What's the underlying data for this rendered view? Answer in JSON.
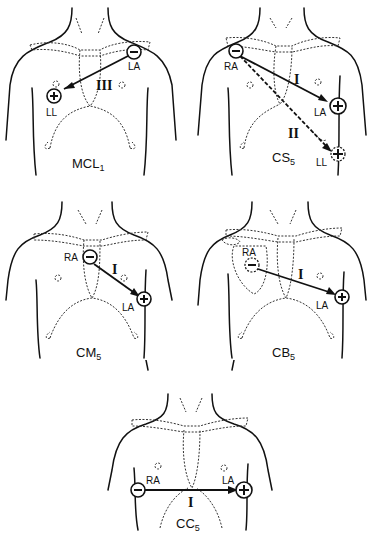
{
  "diagram": {
    "type": "ECG bipolar chest lead placements",
    "panels": [
      {
        "id": "mcl1",
        "title": "MCL",
        "title_subscript": "1",
        "negative_electrode": "LA",
        "positive_electrode": "LL",
        "lead": "III",
        "lead_style": "solid"
      },
      {
        "id": "cs5",
        "title": "CS",
        "title_subscript": "5",
        "negative_electrode": "RA",
        "positive_electrodes": [
          "LA",
          "LL"
        ],
        "leads": [
          {
            "label": "I",
            "from": "RA",
            "to": "LA",
            "style": "solid"
          },
          {
            "label": "II",
            "from": "RA",
            "to": "LL",
            "style": "dashed"
          }
        ]
      },
      {
        "id": "cm5",
        "title": "CM",
        "title_subscript": "5",
        "negative_electrode": "RA",
        "positive_electrode": "LA",
        "lead": "I",
        "lead_style": "solid"
      },
      {
        "id": "cb5",
        "title": "CB",
        "title_subscript": "5",
        "negative_electrode": "RA",
        "positive_electrode": "LA",
        "lead": "I",
        "lead_style": "solid"
      },
      {
        "id": "cc5",
        "title": "CC",
        "title_subscript": "5",
        "negative_electrode": "RA",
        "positive_electrode": "LA",
        "lead": "I",
        "lead_style": "solid"
      }
    ],
    "symbols": {
      "negative": "−",
      "positive": "+"
    }
  }
}
